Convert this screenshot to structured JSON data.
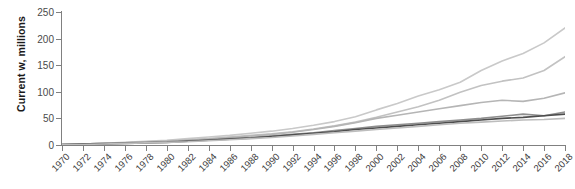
{
  "chart_data": {
    "type": "line",
    "title": "",
    "subtitle": "",
    "xlabel": "",
    "ylabel": "Current w, millions",
    "xlim": [
      1970,
      2018
    ],
    "ylim": [
      0,
      250
    ],
    "grid": false,
    "legend": "none",
    "y_ticks": [
      250,
      200,
      150,
      100,
      50,
      0
    ],
    "x_ticks": [
      1970,
      1972,
      1974,
      1976,
      1978,
      1980,
      1982,
      1984,
      1986,
      1988,
      1990,
      1992,
      1994,
      1996,
      1998,
      2000,
      2002,
      2004,
      2006,
      2008,
      2010,
      2012,
      2014,
      2016,
      2018
    ],
    "x": [
      1970,
      1972,
      1974,
      1976,
      1978,
      1980,
      1982,
      1984,
      1986,
      1988,
      1990,
      1992,
      1994,
      1996,
      1998,
      2000,
      2002,
      2004,
      2006,
      2008,
      2010,
      2012,
      2014,
      2016,
      2018
    ],
    "series": [
      {
        "name": "series-1",
        "color": "#c9c9c9",
        "values": [
          1,
          2,
          3,
          5,
          7,
          9,
          12,
          15,
          18,
          22,
          26,
          31,
          37,
          44,
          53,
          66,
          78,
          92,
          104,
          118,
          140,
          158,
          172,
          192,
          220
        ]
      },
      {
        "name": "series-2",
        "color": "#c2c2c2",
        "values": [
          1,
          2,
          3,
          4,
          6,
          8,
          10,
          12,
          15,
          18,
          21,
          25,
          30,
          36,
          43,
          52,
          62,
          72,
          84,
          99,
          112,
          120,
          126,
          140,
          166
        ]
      },
      {
        "name": "series-3",
        "color": "#b5b5b5",
        "values": [
          1,
          2,
          3,
          4,
          5,
          7,
          9,
          11,
          14,
          17,
          20,
          24,
          29,
          35,
          42,
          50,
          56,
          62,
          68,
          74,
          80,
          84,
          82,
          88,
          98
        ]
      },
      {
        "name": "series-4",
        "color": "#8f8f8f",
        "values": [
          1,
          2,
          3,
          4,
          5,
          6,
          8,
          10,
          12,
          14,
          17,
          20,
          23,
          27,
          31,
          35,
          38,
          41,
          44,
          47,
          50,
          54,
          58,
          55,
          62
        ]
      },
      {
        "name": "series-5",
        "color": "#4d4d4d",
        "values": [
          1,
          2,
          2,
          3,
          4,
          5,
          7,
          9,
          11,
          13,
          16,
          19,
          22,
          25,
          29,
          32,
          35,
          38,
          41,
          44,
          47,
          50,
          52,
          55,
          58
        ]
      },
      {
        "name": "series-6",
        "color": "#bdbdbd",
        "values": [
          1,
          1,
          2,
          3,
          4,
          5,
          6,
          8,
          10,
          12,
          14,
          17,
          20,
          23,
          26,
          29,
          32,
          35,
          38,
          41,
          43,
          45,
          47,
          48,
          50
        ]
      }
    ]
  }
}
